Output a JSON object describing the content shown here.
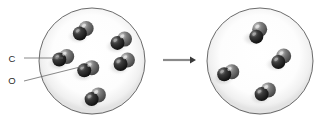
{
  "diagram": {
    "type": "particle-diagram",
    "background_color": "#ffffff",
    "transition": {
      "arrow": {
        "name": "reaction-arrow",
        "direction": "right",
        "glyph": "→",
        "x1": 163,
        "y1": 60,
        "x2": 196,
        "y2": 60,
        "color": "#8a8a8a"
      }
    },
    "legend": {
      "items": [
        {
          "id": "carbon",
          "label": "C",
          "label_x": 12,
          "label_y": 62,
          "atom_color": "#1d1d1d",
          "leader": {
            "x1": 24,
            "y1": 58,
            "x2": 63,
            "y2": 58
          }
        },
        {
          "id": "oxygen",
          "label": "O",
          "label_x": 12,
          "label_y": 84,
          "atom_color": "#5a5a5a",
          "leader": {
            "x1": 24,
            "y1": 81,
            "x2": 84,
            "y2": 66
          }
        }
      ]
    },
    "panels": [
      {
        "id": "left-panel",
        "name": "reactant-container",
        "circle": {
          "cx": 92,
          "cy": 61,
          "r": 53
        },
        "circle_stroke": "#5b5b5b",
        "circle_fill": "#ffffff",
        "molecule_count": 6,
        "molecule_formula": "CO",
        "molecules": [
          {
            "cx": 83,
            "cy": 31,
            "angle": -38
          },
          {
            "cx": 121,
            "cy": 41,
            "angle": -28
          },
          {
            "cx": 63,
            "cy": 58,
            "angle": -22
          },
          {
            "cx": 124,
            "cy": 62,
            "angle": -30
          },
          {
            "cx": 88,
            "cy": 69,
            "angle": -20
          },
          {
            "cx": 95,
            "cy": 97,
            "angle": -32
          }
        ]
      },
      {
        "id": "right-panel",
        "name": "product-container",
        "circle": {
          "cx": 260,
          "cy": 61,
          "r": 53
        },
        "circle_stroke": "#5b5b5b",
        "circle_fill": "#ffffff",
        "molecule_count": 4,
        "molecule_formula": "CO",
        "molecules": [
          {
            "cx": 258,
            "cy": 33,
            "angle": -65
          },
          {
            "cx": 228,
            "cy": 73,
            "angle": -18
          },
          {
            "cx": 281,
            "cy": 59,
            "angle": -48
          },
          {
            "cx": 265,
            "cy": 92,
            "angle": -32
          }
        ]
      }
    ],
    "atom_style": {
      "carbon_radius": 7,
      "oxygen_radius": 7.5,
      "bond_offset": 8,
      "carbon_color": "#1d1d1d",
      "carbon_highlight": "#6e6e6e",
      "oxygen_color": "#555555",
      "oxygen_highlight": "#a8a8a8",
      "shadow_color": "#d8d8d8"
    }
  }
}
